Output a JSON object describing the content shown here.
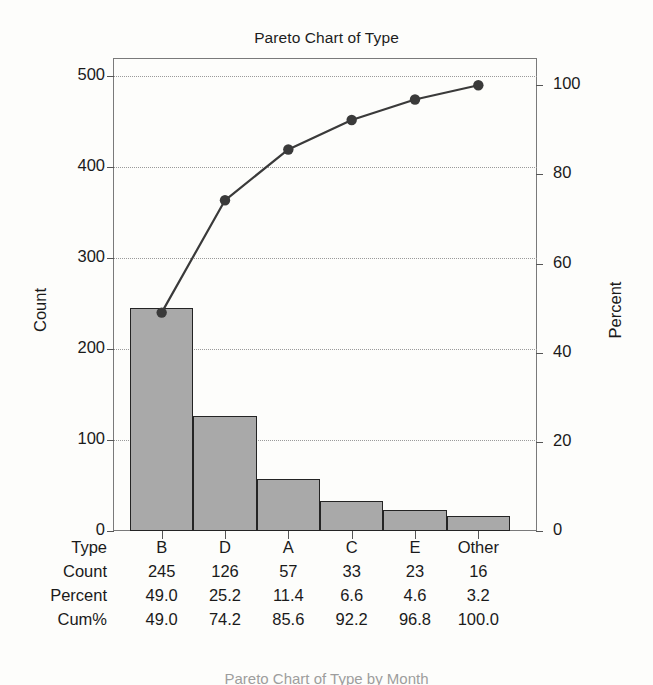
{
  "chart_data": {
    "type": "bar",
    "title": "Pareto Chart of Type",
    "xlabel": "",
    "ylabel": "Count",
    "y2label": "Percent",
    "categories": [
      "B",
      "D",
      "A",
      "C",
      "E",
      "Other"
    ],
    "values": [
      245,
      126,
      57,
      33,
      23,
      16
    ],
    "series": [
      {
        "name": "Count",
        "type": "bar",
        "values": [
          245,
          126,
          57,
          33,
          23,
          16
        ]
      },
      {
        "name": "Cum%",
        "type": "line",
        "values": [
          49.0,
          74.2,
          85.6,
          92.2,
          96.8,
          100.0
        ]
      }
    ],
    "percent": [
      49.0,
      25.2,
      11.4,
      6.6,
      4.6,
      3.2
    ],
    "cum_percent": [
      49.0,
      74.2,
      85.6,
      92.2,
      96.8,
      100.0
    ],
    "ylim": [
      0,
      520
    ],
    "y2lim": [
      0,
      106.12
    ],
    "yticks": [
      0,
      100,
      200,
      300,
      400,
      500
    ],
    "y2ticks": [
      0,
      20,
      40,
      60,
      80,
      100
    ],
    "grid": true,
    "legend": "none",
    "bar_color": "#a9a9a9",
    "bar_edge_color": "#242424",
    "line_color": "#3a3a3a",
    "grid_color": "#9a9a9a"
  },
  "axes": {
    "left_title": "Count",
    "right_title": "Percent",
    "left_ticks": [
      "500",
      "400",
      "300",
      "200",
      "100",
      "0"
    ],
    "right_ticks": [
      "100",
      "80",
      "60",
      "40",
      "20",
      "0"
    ]
  },
  "table": {
    "rows": [
      {
        "label": "Type",
        "values": [
          "B",
          "D",
          "A",
          "C",
          "E",
          "Other"
        ]
      },
      {
        "label": "Count",
        "values": [
          "245",
          "126",
          "57",
          "33",
          "23",
          "16"
        ]
      },
      {
        "label": "Percent",
        "values": [
          "49.0",
          "25.2",
          "11.4",
          "6.6",
          "4.6",
          "3.2"
        ]
      },
      {
        "label": "Cum%",
        "values": [
          "49.0",
          "74.2",
          "85.6",
          "92.2",
          "96.8",
          "100.0"
        ]
      }
    ]
  },
  "next_figure_caption": "Pareto Chart of Type by Month"
}
